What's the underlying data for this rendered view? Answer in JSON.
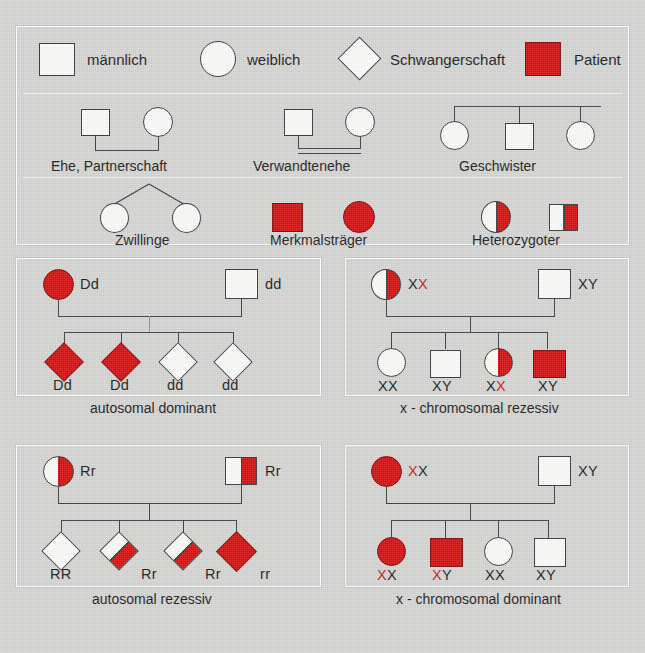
{
  "colors": {
    "affected_red": "#d81212",
    "genotype_red": "#cc2020",
    "line": "#3f3f3f",
    "background": "#d6d6d4"
  },
  "legend": {
    "row1": [
      {
        "label": "männlich",
        "shape": "square",
        "fill": "empty"
      },
      {
        "label": "weiblich",
        "shape": "circle",
        "fill": "empty"
      },
      {
        "label": "Schwangerschaft",
        "shape": "diamond",
        "fill": "empty"
      },
      {
        "label": "Patient",
        "shape": "square",
        "fill": "red"
      }
    ],
    "row2": [
      {
        "label": "Ehe, Partnerschaft",
        "shapes": [
          "square",
          "circle"
        ],
        "connector": "single-marriage-line"
      },
      {
        "label": "Verwandtenehe",
        "shapes": [
          "square",
          "circle"
        ],
        "connector": "double-marriage-line"
      },
      {
        "label": "Geschwister",
        "shapes": [
          "circle",
          "square",
          "circle"
        ],
        "connector": "sibship-line"
      }
    ],
    "row3": [
      {
        "label": "Zwillinge",
        "shapes": [
          "circle",
          "circle"
        ],
        "connector": "twin-apex"
      },
      {
        "label": "Merkmalsträger",
        "shapes": [
          "square",
          "circle"
        ],
        "fill": "red"
      },
      {
        "label": "Heterozygoter",
        "shapes": [
          "circle",
          "square"
        ],
        "fill": "half-red"
      }
    ]
  },
  "panels": [
    {
      "id": "autosomal-dominant",
      "caption": "autosomal dominant",
      "parents": [
        {
          "shape": "circle",
          "fill": "red",
          "genotype": "Dd",
          "genotype_parts": [
            {
              "t": "Dd",
              "c": "black"
            }
          ]
        },
        {
          "shape": "square",
          "fill": "empty",
          "genotype": "dd",
          "genotype_parts": [
            {
              "t": "dd",
              "c": "black"
            }
          ]
        }
      ],
      "children": [
        {
          "shape": "diamond",
          "fill": "red",
          "genotype": "Dd"
        },
        {
          "shape": "diamond",
          "fill": "red",
          "genotype": "Dd"
        },
        {
          "shape": "diamond",
          "fill": "empty",
          "genotype": "dd"
        },
        {
          "shape": "diamond",
          "fill": "empty",
          "genotype": "dd"
        }
      ]
    },
    {
      "id": "x-chromosomal-rezessiv",
      "caption": "x - chromosomal rezessiv",
      "parents": [
        {
          "shape": "circle",
          "fill": "half-red",
          "genotype": "XX",
          "genotype_parts": [
            {
              "t": "X",
              "c": "black"
            },
            {
              "t": "X",
              "c": "red"
            }
          ]
        },
        {
          "shape": "square",
          "fill": "empty",
          "genotype": "XY",
          "genotype_parts": [
            {
              "t": "XY",
              "c": "black"
            }
          ]
        }
      ],
      "children": [
        {
          "shape": "circle",
          "fill": "empty",
          "genotype_parts": [
            {
              "t": "XX",
              "c": "black"
            }
          ]
        },
        {
          "shape": "square",
          "fill": "empty",
          "genotype_parts": [
            {
              "t": "XY",
              "c": "black"
            }
          ]
        },
        {
          "shape": "circle",
          "fill": "half-red",
          "genotype_parts": [
            {
              "t": "X",
              "c": "black"
            },
            {
              "t": "X",
              "c": "red"
            }
          ]
        },
        {
          "shape": "square",
          "fill": "red",
          "genotype_parts": [
            {
              "t": "XY",
              "c": "red"
            }
          ]
        }
      ]
    },
    {
      "id": "autosomal-rezessiv",
      "caption": "autosomal rezessiv",
      "parents": [
        {
          "shape": "circle",
          "fill": "half-red",
          "genotype": "Rr",
          "genotype_parts": [
            {
              "t": "Rr",
              "c": "black"
            }
          ]
        },
        {
          "shape": "square",
          "fill": "half-red",
          "genotype": "Rr",
          "genotype_parts": [
            {
              "t": "Rr",
              "c": "black"
            }
          ]
        }
      ],
      "children": [
        {
          "shape": "diamond",
          "fill": "empty",
          "genotype": "RR"
        },
        {
          "shape": "diamond",
          "fill": "half-red",
          "genotype": "Rr"
        },
        {
          "shape": "diamond",
          "fill": "half-red",
          "genotype": "Rr"
        },
        {
          "shape": "diamond",
          "fill": "red",
          "genotype": "rr"
        }
      ]
    },
    {
      "id": "x-chromosomal-dominant",
      "caption": "x - chromosomal dominant",
      "parents": [
        {
          "shape": "circle",
          "fill": "red",
          "genotype": "XX",
          "genotype_parts": [
            {
              "t": "X",
              "c": "red"
            },
            {
              "t": "X",
              "c": "black"
            }
          ]
        },
        {
          "shape": "square",
          "fill": "empty",
          "genotype": "XY",
          "genotype_parts": [
            {
              "t": "XY",
              "c": "black"
            }
          ]
        }
      ],
      "children": [
        {
          "shape": "circle",
          "fill": "red",
          "genotype_parts": [
            {
              "t": "X",
              "c": "red"
            },
            {
              "t": "X",
              "c": "black"
            }
          ]
        },
        {
          "shape": "square",
          "fill": "red",
          "genotype_parts": [
            {
              "t": "X",
              "c": "red"
            },
            {
              "t": "Y",
              "c": "black"
            }
          ]
        },
        {
          "shape": "circle",
          "fill": "empty",
          "genotype_parts": [
            {
              "t": "XX",
              "c": "black"
            }
          ]
        },
        {
          "shape": "square",
          "fill": "empty",
          "genotype_parts": [
            {
              "t": "XY",
              "c": "black"
            }
          ]
        }
      ]
    }
  ]
}
